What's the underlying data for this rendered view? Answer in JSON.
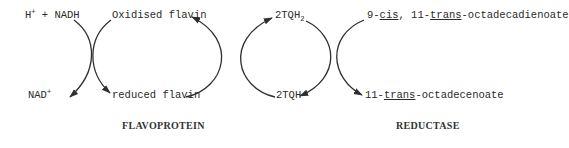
{
  "diagram": {
    "type": "coupled-reaction-scheme",
    "enzymes": {
      "left": "FLAVOPROTEIN",
      "right": "REDUCTASE"
    },
    "nodes": {
      "h_nadh": {
        "prefix": "H",
        "sup": "+",
        "rest": " + NADH"
      },
      "nad": {
        "text": "NAD",
        "sup": "+"
      },
      "oxidised_flavin": "Oxidised flavin",
      "reduced_flavin": "reduced flavin",
      "tqh2": {
        "text": "2TQH",
        "sub": "2"
      },
      "tqh": "2TQH",
      "diene": {
        "p1": "9-",
        "cis": "cis",
        "p2": ", 11-",
        "trans": "trans",
        "p3": "-octadecadienoate"
      },
      "monoene": {
        "p1": "11-",
        "trans": "trans",
        "p2": "-octadecenoate"
      }
    },
    "edges": [
      {
        "from": "H+ + NADH",
        "to": "NAD+",
        "via": "FLAVOPROTEIN"
      },
      {
        "from": "Oxidised flavin",
        "to": "reduced flavin",
        "via": "FLAVOPROTEIN"
      },
      {
        "from": "reduced flavin",
        "to": "Oxidised flavin",
        "via": "2TQH -> 2TQH2 coupling"
      },
      {
        "from": "2TQH",
        "to": "2TQH2",
        "via": "coupling"
      },
      {
        "from": "2TQH2",
        "to": "2TQH",
        "via": "REDUCTASE"
      },
      {
        "from": "9-cis, 11-trans-octadecadienoate",
        "to": "11-trans-octadecenoate",
        "via": "REDUCTASE"
      }
    ],
    "colors": {
      "line": "#2f2f2f",
      "text": "#2a2a2a",
      "background": "#ffffff"
    }
  }
}
